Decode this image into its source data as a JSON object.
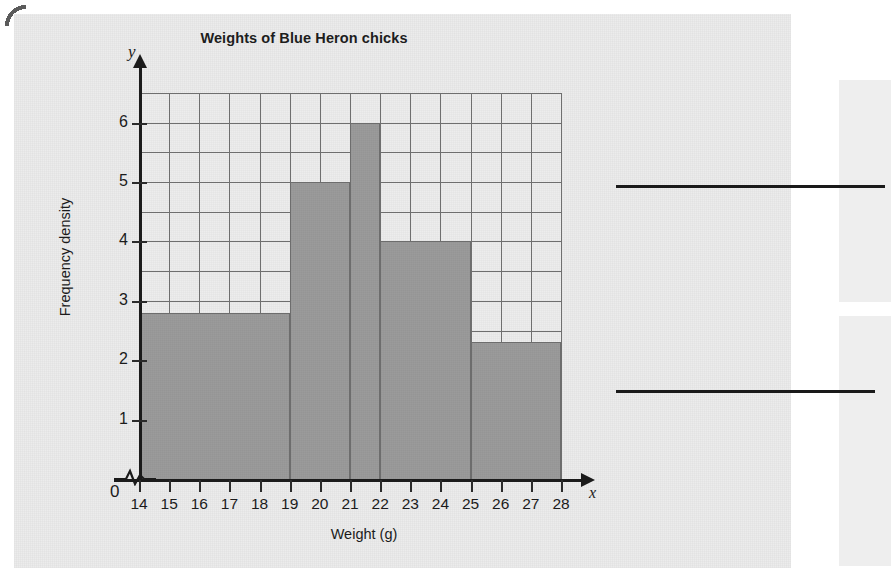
{
  "page": {
    "background_color": "#ececec",
    "corner_mark": "page-curl"
  },
  "chart_data": {
    "type": "bar",
    "title": "Weights of Blue Heron chicks",
    "xlabel": "Weight (g)",
    "ylabel": "Frequency density",
    "x_axis_symbol": "x",
    "y_axis_symbol": "y",
    "zero_label": "0",
    "axis_break": true,
    "grid": true,
    "xlim": [
      14,
      28
    ],
    "ylim": [
      0,
      6.5
    ],
    "x_ticks": [
      14,
      15,
      16,
      17,
      18,
      19,
      20,
      21,
      22,
      23,
      24,
      25,
      26,
      27,
      28
    ],
    "x_tick_labels": [
      "14",
      "15",
      "16",
      "17",
      "18",
      "19",
      "20",
      "21",
      "22",
      "23",
      "24",
      "25",
      "26",
      "27",
      "28"
    ],
    "y_ticks": [
      1,
      2,
      3,
      4,
      5,
      6
    ],
    "y_tick_labels": [
      "1",
      "2",
      "3",
      "4",
      "5",
      "6"
    ],
    "y_gridline_step": 0.5,
    "x_gridline_step": 1,
    "bar_color": "#9b9b9b",
    "bin_edges": [
      14,
      19,
      21,
      22,
      25,
      28
    ],
    "bars": [
      {
        "x_start": 14,
        "x_end": 19,
        "frequency_density": 2.8
      },
      {
        "x_start": 19,
        "x_end": 21,
        "frequency_density": 5
      },
      {
        "x_start": 21,
        "x_end": 22,
        "frequency_density": 6
      },
      {
        "x_start": 22,
        "x_end": 25,
        "frequency_density": 4
      },
      {
        "x_start": 25,
        "x_end": 28,
        "frequency_density": 2.3
      }
    ]
  },
  "answer_area": {
    "line_count": 2,
    "lines": [
      "",
      ""
    ]
  }
}
